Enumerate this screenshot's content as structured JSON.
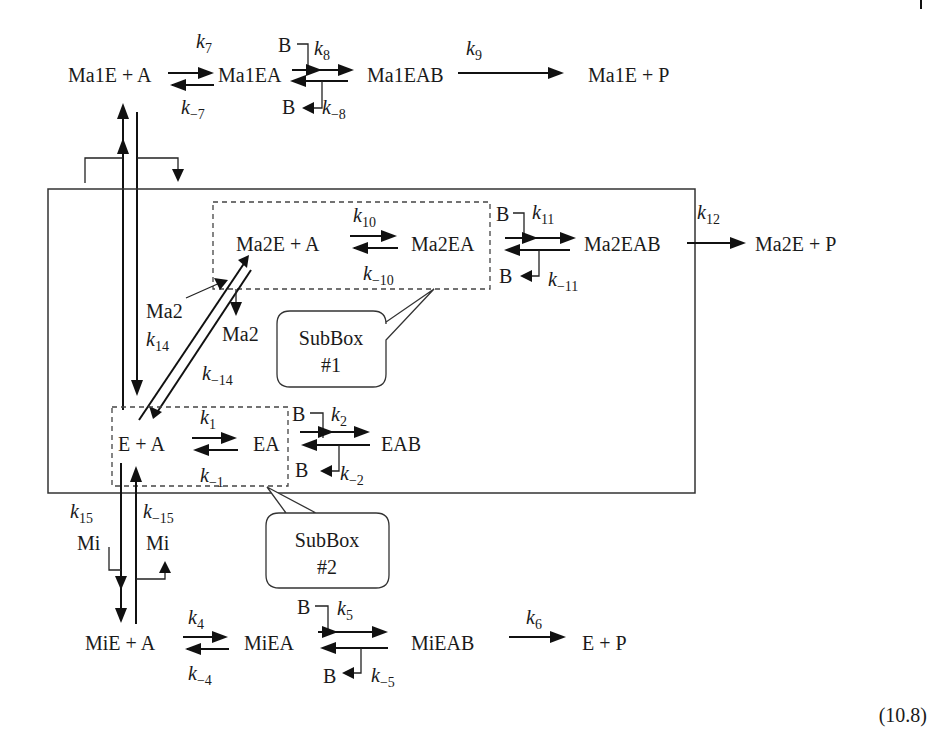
{
  "equation_number": "(10.8)",
  "species": {
    "ma1e_a": "Ma1E + A",
    "ma1ea": "Ma1EA",
    "ma1eab": "Ma1EAB",
    "ma1e_p": "Ma1E + P",
    "ma2e_a": "Ma2E + A",
    "ma2ea": "Ma2EA",
    "ma2eab": "Ma2EAB",
    "ma2e_p": "Ma2E + P",
    "e_a": "E + A",
    "ea": "EA",
    "eab": "EAB",
    "mie_a": "MiE + A",
    "miea": "MiEA",
    "mieab": "MiEAB",
    "e_p": "E + P",
    "b": "B",
    "ma2": "Ma2",
    "mi": "Mi"
  },
  "rate_constants": {
    "k1": {
      "base": "k",
      "sub": "1"
    },
    "km1": {
      "base": "k",
      "sub": "−1"
    },
    "k2": {
      "base": "k",
      "sub": "2"
    },
    "km2": {
      "base": "k",
      "sub": "−2"
    },
    "k4": {
      "base": "k",
      "sub": "4"
    },
    "km4": {
      "base": "k",
      "sub": "−4"
    },
    "k5": {
      "base": "k",
      "sub": "5"
    },
    "km5": {
      "base": "k",
      "sub": "−5"
    },
    "k6": {
      "base": "k",
      "sub": "6"
    },
    "k7": {
      "base": "k",
      "sub": "7"
    },
    "km7": {
      "base": "k",
      "sub": "−7"
    },
    "k8": {
      "base": "k",
      "sub": "8"
    },
    "km8": {
      "base": "k",
      "sub": "−8"
    },
    "k9": {
      "base": "k",
      "sub": "9"
    },
    "k10": {
      "base": "k",
      "sub": "10"
    },
    "km10": {
      "base": "k",
      "sub": "−10"
    },
    "k11": {
      "base": "k",
      "sub": "11"
    },
    "km11": {
      "base": "k",
      "sub": "−11"
    },
    "k12": {
      "base": "k",
      "sub": "12"
    },
    "k14": {
      "base": "k",
      "sub": "14"
    },
    "km14": {
      "base": "k",
      "sub": "−14"
    },
    "k15": {
      "base": "k",
      "sub": "15"
    },
    "km15": {
      "base": "k",
      "sub": "−15"
    }
  },
  "subboxes": [
    {
      "line1": "SubBox",
      "line2": "#1"
    },
    {
      "line1": "SubBox",
      "line2": "#2"
    }
  ]
}
